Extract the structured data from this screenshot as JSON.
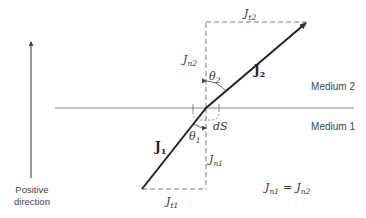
{
  "diagram": {
    "medium_top": "Medium 2",
    "medium_bottom": "Medium 1",
    "positive_direction": [
      "Positive",
      "direction"
    ],
    "vectors": {
      "J1": {
        "label": "J",
        "sub": "1"
      },
      "J2": {
        "label": "J",
        "sub": "2"
      }
    },
    "components": {
      "Jt2": {
        "label": "J",
        "sub": "t2"
      },
      "Jn2": {
        "label": "J",
        "sub": "n2"
      },
      "Jt1": {
        "label": "J",
        "sub": "t1"
      },
      "Jn1": {
        "label": "J",
        "sub": "n1"
      }
    },
    "angles": {
      "theta1": {
        "label": "θ",
        "sub": "1"
      },
      "theta2": {
        "label": "θ",
        "sub": "2"
      }
    },
    "surface_element": "dS",
    "equation": {
      "lhs": {
        "label": "J",
        "sub": "n1"
      },
      "op": "=",
      "rhs": {
        "label": "J",
        "sub": "n2"
      }
    },
    "colors": {
      "line": "#333333",
      "interface": "#888888",
      "dashed": "#777777"
    }
  }
}
